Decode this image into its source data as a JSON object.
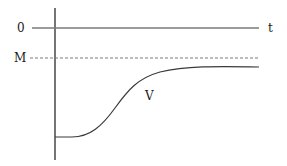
{
  "diagram": {
    "labels": {
      "zero": "0",
      "M": "M",
      "t": "t",
      "V": "V"
    },
    "colors": {
      "axis": "#2a2a2a",
      "zero_line": "#7a7a7a",
      "dashed": "#7a7a7a",
      "curve": "#3a3a3a"
    },
    "elements": {
      "vertical_axis": {
        "x": 55,
        "y_top": 8,
        "y_bottom": 160
      },
      "zero_line": {
        "y": 28,
        "x_start": 32,
        "x_end": 259
      },
      "M_dashed_line": {
        "y": 58,
        "x_start": 30,
        "x_end": 259
      },
      "curve_V": {
        "start_y": 137,
        "asymptote_y": 68,
        "x_start": 55,
        "x_end": 259,
        "shape": "sigmoid rising toward asymptote below M"
      }
    }
  }
}
